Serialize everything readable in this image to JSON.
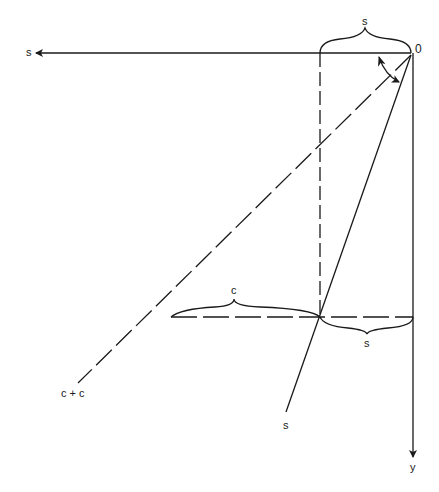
{
  "figure": {
    "labels": {
      "s_axis": "s",
      "origin": "0",
      "top_brace": "s",
      "c_brace": "c",
      "bottom_brace": "s",
      "c_plus_c": "c + c",
      "s_line": "s",
      "y_axis": "y"
    },
    "colors": {
      "stroke": "#1a1a1a",
      "background": "#ffffff"
    }
  }
}
